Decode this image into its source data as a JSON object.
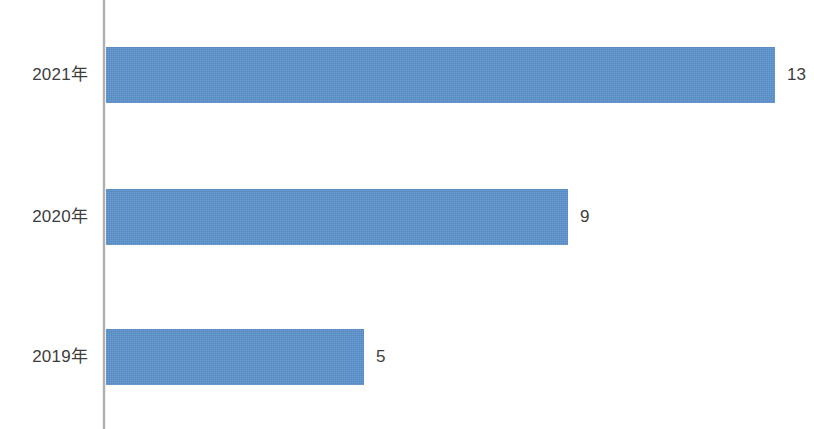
{
  "chart_data": {
    "type": "bar",
    "orientation": "horizontal",
    "title": "",
    "subtitle": "",
    "xlabel": "",
    "ylabel": "",
    "grid": false,
    "legend": null,
    "legend_position": "none",
    "axis": {
      "category_axis": "y",
      "value_axis": "x",
      "value_axis_visible": false,
      "category_axis_line_color": "#b0b0b0",
      "xlim": [
        0,
        13
      ]
    },
    "categories": [
      "2021年",
      "2020年",
      "2019年"
    ],
    "values": [
      13,
      9,
      5
    ],
    "data_labels": [
      "13",
      "9",
      "5"
    ],
    "data_labels_visible": true,
    "series": [
      {
        "name": "",
        "values": [
          13,
          9,
          5
        ],
        "color": "#5b93cd"
      }
    ],
    "colors": {
      "bar": "#5b93cd",
      "label_text": "#3d3d3d",
      "axis_line": "#b0b0b0",
      "background": "#ffffff"
    },
    "bars": [
      {
        "category": "2021年",
        "value": 13,
        "label": "13",
        "bar_px": 669
      },
      {
        "category": "2020年",
        "value": 9,
        "label": "9",
        "bar_px": 462
      },
      {
        "category": "2019年",
        "value": 5,
        "label": "5",
        "bar_px": 258
      }
    ]
  }
}
